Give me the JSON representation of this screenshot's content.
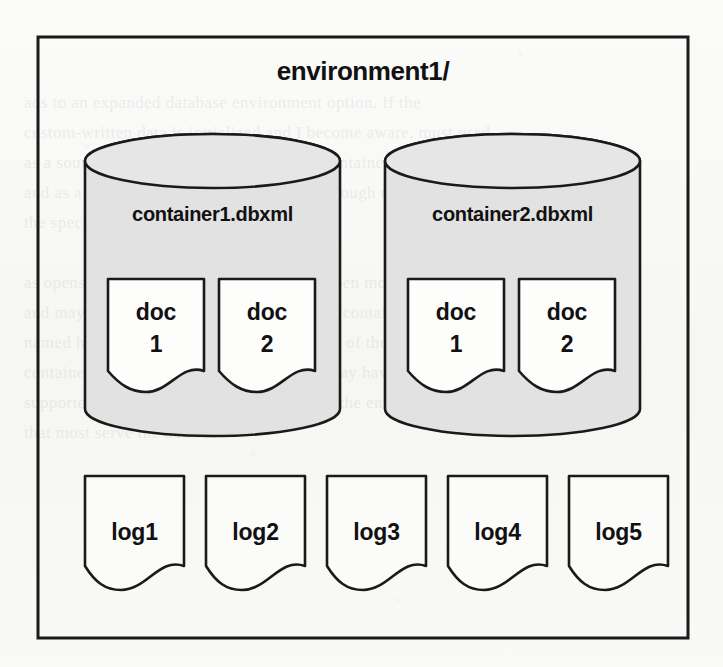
{
  "diagram": {
    "title": "environment1/",
    "frame": {
      "x": 38,
      "y": 37,
      "width": 650,
      "height": 601
    },
    "containers": [
      {
        "label": "container1.dbxml",
        "id": "container1",
        "x": 85,
        "y": 134,
        "width": 255,
        "height": 302,
        "fill": "#e2e2e2",
        "stroke": "#1a1a1a",
        "documents": [
          {
            "label_line1": "doc",
            "label_line2": "1",
            "id": "doc1",
            "x": 108,
            "y": 279,
            "width": 96,
            "height": 113
          },
          {
            "label_line1": "doc",
            "label_line2": "2",
            "id": "doc2",
            "x": 219,
            "y": 279,
            "width": 96,
            "height": 113
          }
        ]
      },
      {
        "label": "container2.dbxml",
        "id": "container2",
        "x": 385,
        "y": 134,
        "width": 255,
        "height": 302,
        "fill": "#e2e2e2",
        "stroke": "#1a1a1a",
        "documents": [
          {
            "label_line1": "doc",
            "label_line2": "1",
            "id": "doc1",
            "x": 408,
            "y": 279,
            "width": 96,
            "height": 113
          },
          {
            "label_line1": "doc",
            "label_line2": "2",
            "id": "doc2",
            "x": 519,
            "y": 279,
            "width": 96,
            "height": 113
          }
        ]
      }
    ],
    "logs": [
      {
        "label": "log1",
        "x": 85,
        "y": 476,
        "width": 99,
        "height": 114
      },
      {
        "label": "log2",
        "x": 206,
        "y": 476,
        "width": 99,
        "height": 114
      },
      {
        "label": "log3",
        "x": 327,
        "y": 476,
        "width": 99,
        "height": 114
      },
      {
        "label": "log4",
        "x": 448,
        "y": 476,
        "width": 99,
        "height": 114
      },
      {
        "label": "log5",
        "x": 569,
        "y": 476,
        "width": 99,
        "height": 114
      }
    ],
    "colors": {
      "page_background": "#f8f8f6",
      "cylinder_fill": "#e2e2e2",
      "document_fill": "#fdfdfc",
      "outline": "#1a1a1a",
      "text": "#111111"
    }
  },
  "background_page_text": "ads to an expanded database environment option. If the\ncustom-written data is initialized and I become aware, must used\nas a source control for the container. The container of\nand as a bigger number if other value are enough many\nthe specific reads its container.\n\nas opens of the database is the size of the open mode\nand may be collected into a state so another contained is\nnamed here and the open point in the source of the\ncontainer file names in any container that may have\nsupported the container of the entry will be the entry\nthat most serve the database.\n\n\n\n\n\n\n\n\n\nThe container file as a XML document and larger named"
}
